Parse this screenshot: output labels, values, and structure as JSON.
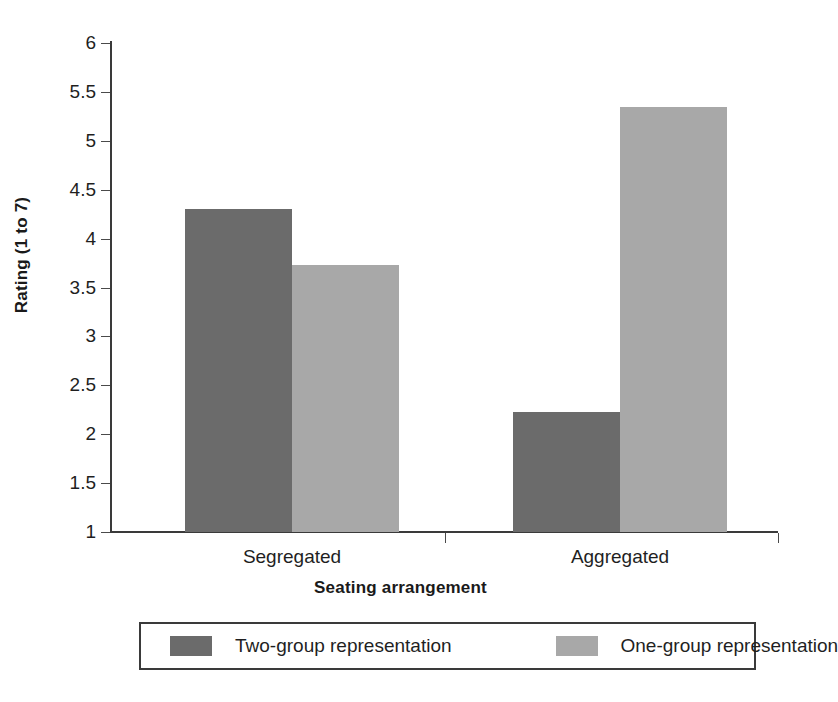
{
  "chart_data": {
    "type": "bar",
    "title": "",
    "xlabel": "Seating arrangement",
    "ylabel": "Rating (1 to 7)",
    "categories": [
      "Segregated",
      "Aggregated"
    ],
    "series": [
      {
        "name": "Two-group representation",
        "color": "#6b6b6b",
        "values": [
          4.3,
          2.23
        ]
      },
      {
        "name": "One-group representation",
        "color": "#a8a8a8",
        "values": [
          3.73,
          5.35
        ]
      }
    ],
    "ylim": [
      1,
      6
    ],
    "ytick_step": 0.5,
    "ytick_labels": [
      "6",
      "5.5",
      "5",
      "4.5",
      "4",
      "3.5",
      "3",
      "2.5",
      "2",
      "1.5",
      "1"
    ],
    "grid": false,
    "legend_position": "bottom"
  },
  "legend": {
    "entries": [
      {
        "label": "Two-group representation",
        "swatch": "dark"
      },
      {
        "label": "One-group representation",
        "swatch": "light"
      }
    ]
  }
}
